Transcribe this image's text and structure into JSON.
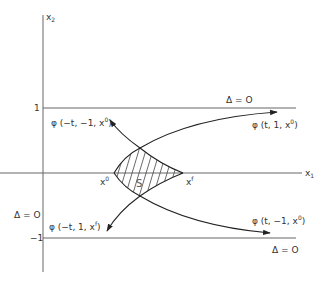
{
  "figure": {
    "axes": {
      "x_axis_label": "x",
      "x_axis_sub": "1",
      "y_axis_label": "x",
      "y_axis_sub": "2",
      "tick_upper": "1",
      "tick_lower": "−1"
    },
    "boundary_labels": {
      "upper": "Δ = O",
      "left": "Δ = O",
      "lower": "Δ = O"
    },
    "points": {
      "start": "x",
      "start_sup": "0",
      "end": "x",
      "end_sup": "f"
    },
    "region_label": "S",
    "trajectories": [
      {
        "label": "φ (t, 1, x",
        "sup": "0",
        "close": ")"
      },
      {
        "label": "φ (t, −1, x",
        "sup": "0",
        "close": ")"
      },
      {
        "label": "φ (−t, −1, x",
        "sup": "0",
        "close": ")"
      },
      {
        "label": "φ (−t, 1, x",
        "sup": "f",
        "close": ")"
      }
    ],
    "colors": {
      "ink": "#333333",
      "axis": "#555555",
      "hatch": "#444444"
    }
  }
}
